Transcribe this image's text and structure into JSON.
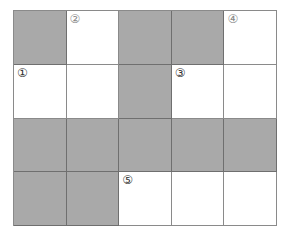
{
  "puzzle": {
    "rows": 4,
    "cols": 5,
    "shaded_color": "#a9a9a9",
    "cells": [
      [
        {
          "shaded": true,
          "label": ""
        },
        {
          "shaded": false,
          "label": "②"
        },
        {
          "shaded": true,
          "label": ""
        },
        {
          "shaded": true,
          "label": ""
        },
        {
          "shaded": false,
          "label": "④"
        }
      ],
      [
        {
          "shaded": false,
          "label": "①"
        },
        {
          "shaded": false,
          "label": ""
        },
        {
          "shaded": true,
          "label": ""
        },
        {
          "shaded": false,
          "label": "③"
        },
        {
          "shaded": false,
          "label": ""
        }
      ],
      [
        {
          "shaded": true,
          "label": ""
        },
        {
          "shaded": true,
          "label": ""
        },
        {
          "shaded": true,
          "label": ""
        },
        {
          "shaded": true,
          "label": ""
        },
        {
          "shaded": true,
          "label": ""
        }
      ],
      [
        {
          "shaded": true,
          "label": ""
        },
        {
          "shaded": true,
          "label": ""
        },
        {
          "shaded": false,
          "label": "⑤"
        },
        {
          "shaded": false,
          "label": ""
        },
        {
          "shaded": false,
          "label": ""
        }
      ]
    ]
  }
}
